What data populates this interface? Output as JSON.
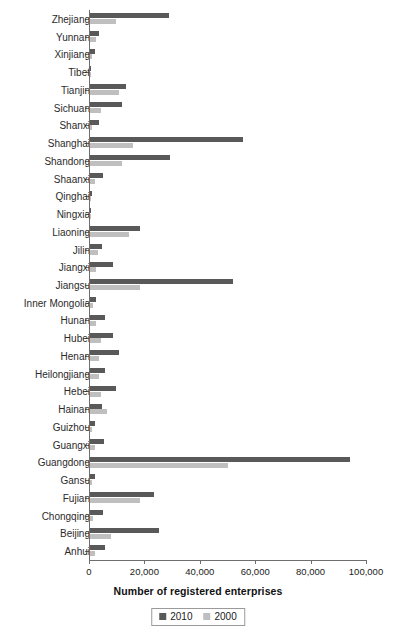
{
  "chart_data": {
    "type": "bar",
    "orientation": "horizontal",
    "title": "",
    "xlabel": "Number of registered enterprises",
    "ylabel": "",
    "xlim": [
      0,
      100000
    ],
    "xticks": [
      0,
      20000,
      40000,
      60000,
      80000,
      100000
    ],
    "xtick_labels": [
      "0",
      "20,000",
      "40,000",
      "60,000",
      "80,000",
      "100,000"
    ],
    "grid": false,
    "legend_position": "bottom-center",
    "colors": {
      "y2010": "#595959",
      "y2000": "#bfbfbf",
      "axis": "#6e6e6e"
    },
    "categories": [
      "Zhejiang",
      "Yunnan",
      "Xinjiang",
      "Tibet",
      "Tianjin",
      "Sichuan",
      "Shanxi",
      "Shanghai",
      "Shandong",
      "Shaanxi",
      "Qinghai",
      "Ningxia",
      "Liaoning",
      "Jilin",
      "Jiangxi",
      "Jiangsu",
      "Inner Mongolia",
      "Hunan",
      "Hubei",
      "Henan",
      "Heilongjiang",
      "Hebei",
      "Hainan",
      "Guizhou",
      "Guangxi",
      "Guangdong",
      "Gansu",
      "Fujian",
      "Chongqing",
      "Beijing",
      "Anhui"
    ],
    "series": [
      {
        "name": "2010",
        "color": "#595959",
        "values": [
          28600,
          3400,
          1700,
          300,
          13000,
          11600,
          3100,
          55300,
          29000,
          4600,
          600,
          500,
          18100,
          4300,
          8300,
          51700,
          2200,
          5500,
          8200,
          10500,
          5500,
          9400,
          4300,
          1900,
          4900,
          93700,
          1900,
          23200,
          4600,
          25000,
          5400
        ]
      },
      {
        "name": "2000",
        "color": "#bfbfbf",
        "values": [
          9400,
          2000,
          800,
          100,
          10400,
          4000,
          900,
          15500,
          11600,
          1800,
          300,
          300,
          14000,
          2900,
          2200,
          18100,
          1000,
          2300,
          3900,
          3200,
          3100,
          4100,
          6200,
          900,
          1800,
          49900,
          700,
          18200,
          1200,
          7600,
          1900
        ]
      }
    ]
  },
  "axis": {
    "x_title": "Number of registered enterprises"
  },
  "legend": {
    "entries": [
      {
        "label": "2010",
        "swatch": "dark-gray-square"
      },
      {
        "label": "2000",
        "swatch": "light-gray-square"
      }
    ]
  }
}
